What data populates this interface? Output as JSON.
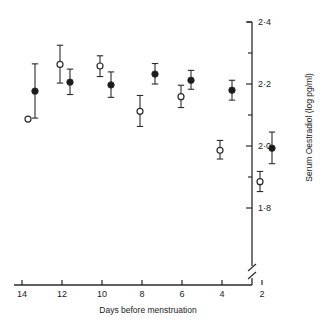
{
  "chart_data": {
    "type": "scatter",
    "title": "",
    "xlabel": "Days before menstruation",
    "ylabel": "Serum Oestradiol (log pg/ml)",
    "xlim": [
      15,
      0.6
    ],
    "ylim": [
      1.73,
      2.42
    ],
    "x_ticks": [
      14,
      12,
      10,
      8,
      6,
      4,
      2
    ],
    "x_tick_labels": [
      "14",
      "12",
      "10",
      "8",
      "6",
      "4",
      "2"
    ],
    "y_ticks": [
      2.4,
      2.3,
      2.2,
      2.1,
      2.0,
      1.9,
      1.8
    ],
    "y_tick_labels": [
      "2·4",
      "",
      "2·2",
      "",
      "2·0",
      "",
      "1·8"
    ],
    "y_major": [
      2.4,
      2.2,
      2.0,
      1.8
    ],
    "grid": false,
    "legend": "none",
    "axis_break": {
      "axis": "y",
      "position": 1.762,
      "style": "double-slash"
    },
    "series": [
      {
        "name": "open",
        "marker": "open-circle",
        "points": [
          {
            "x": 13.7,
            "y": 2.087,
            "err_low": null,
            "err_high": null
          },
          {
            "x": 12.1,
            "y": 2.263,
            "err_low": 2.203,
            "err_high": 2.325
          },
          {
            "x": 10.1,
            "y": 2.258,
            "err_low": 2.224,
            "err_high": 2.291
          },
          {
            "x": 8.1,
            "y": 2.112,
            "err_low": 2.063,
            "err_high": 2.163
          },
          {
            "x": 6.05,
            "y": 2.159,
            "err_low": 2.124,
            "err_high": 2.196
          },
          {
            "x": 4.1,
            "y": 1.986,
            "err_low": 1.958,
            "err_high": 2.018
          },
          {
            "x": 2.1,
            "y": 1.885,
            "err_low": 1.853,
            "err_high": 1.918
          }
        ]
      },
      {
        "name": "filled",
        "marker": "filled-circle",
        "points": [
          {
            "x": 13.35,
            "y": 2.177,
            "err_low": 2.09,
            "err_high": 2.265
          },
          {
            "x": 11.6,
            "y": 2.206,
            "err_low": 2.166,
            "err_high": 2.248
          },
          {
            "x": 9.55,
            "y": 2.197,
            "err_low": 2.157,
            "err_high": 2.239
          },
          {
            "x": 7.35,
            "y": 2.232,
            "err_low": 2.2,
            "err_high": 2.266
          },
          {
            "x": 5.55,
            "y": 2.212,
            "err_low": 2.183,
            "err_high": 2.244
          },
          {
            "x": 3.5,
            "y": 2.18,
            "err_low": 2.148,
            "err_high": 2.212
          },
          {
            "x": 1.5,
            "y": 1.993,
            "err_low": 1.943,
            "err_high": 2.045
          }
        ]
      }
    ]
  }
}
